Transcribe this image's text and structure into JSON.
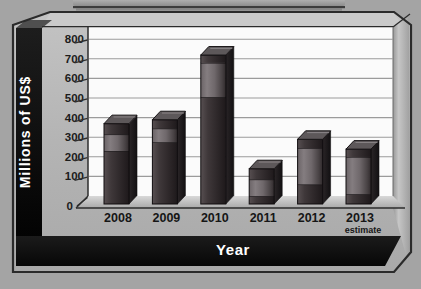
{
  "chart": {
    "y_axis": {
      "title": "Millions of US$",
      "tick_labels": [
        "800",
        "700",
        "600",
        "500",
        "400",
        "300",
        "200",
        "100",
        "0"
      ]
    },
    "x_axis": {
      "title": "Year"
    },
    "categories": [
      {
        "label": "2008",
        "sublabel": ""
      },
      {
        "label": "2009",
        "sublabel": ""
      },
      {
        "label": "2010",
        "sublabel": ""
      },
      {
        "label": "2011",
        "sublabel": ""
      },
      {
        "label": "2012",
        "sublabel": ""
      },
      {
        "label": "2013",
        "sublabel": "estimate"
      }
    ]
  },
  "chart_data": {
    "type": "bar",
    "subtype": "3d-stacked-glossy",
    "title": "",
    "xlabel": "Year",
    "ylabel": "Millions of US$",
    "categories": [
      "2008",
      "2009",
      "2010",
      "2011",
      "2012",
      "2013"
    ],
    "series": [
      {
        "name": "bottom-dark-segment",
        "values": [
          270,
          315,
          545,
          40,
          100,
          50
        ]
      },
      {
        "name": "middle-light-segment",
        "values": [
          85,
          70,
          175,
          85,
          185,
          190
        ]
      },
      {
        "name": "top-dark-segment",
        "values": [
          55,
          45,
          40,
          55,
          45,
          40
        ]
      }
    ],
    "totals": [
      410,
      430,
      760,
      180,
      330,
      280
    ],
    "ylim": [
      0,
      800
    ],
    "ytick_step": 100,
    "grid": true,
    "legend": false,
    "note": "2013 value is an estimate"
  },
  "colors": {
    "page_background": "#a4a4a4",
    "frame_silver": "#b6b6b6",
    "plot_background": "#fbfbfb",
    "gridline": "#9b9b9b",
    "wall_black": "#0a0a0a",
    "bar_dark": "#2f292b",
    "bar_light": "#6f686b",
    "axis_text": "#1c1c1c",
    "title_text": "#ffffff"
  }
}
